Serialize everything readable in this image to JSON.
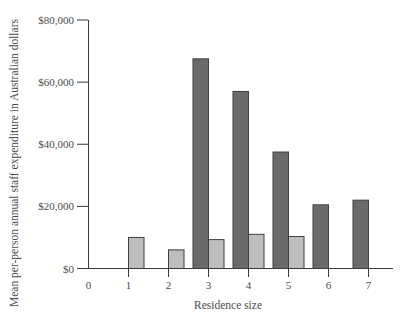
{
  "chart_data": {
    "type": "bar",
    "title": "",
    "xlabel": "Residence size",
    "ylabel": "Mean per-person annual staff expenditure in Australian dollars",
    "x_ticks": [
      "0",
      "1",
      "2",
      "3",
      "4",
      "5",
      "6",
      "7"
    ],
    "categories": [
      1,
      2,
      3,
      4,
      5,
      6,
      7
    ],
    "series": [
      {
        "name": "",
        "style": "dark",
        "color": "#6b6b6b",
        "position": "left-of-tick",
        "values": [
          null,
          null,
          67500,
          57000,
          37500,
          20500,
          22000
        ]
      },
      {
        "name": "",
        "style": "light",
        "color": "#bdbdbd",
        "position": "right-of-tick",
        "values": [
          10000,
          6000,
          9300,
          11000,
          10300,
          null,
          null
        ]
      }
    ],
    "y_ticks": [
      {
        "value": 0,
        "label": "$0"
      },
      {
        "value": 20000,
        "label": "$20,000"
      },
      {
        "value": 40000,
        "label": "$40,000"
      },
      {
        "value": 60000,
        "label": "$60,000"
      },
      {
        "value": 80000,
        "label": "$80,000"
      }
    ],
    "ylim": [
      0,
      80000
    ],
    "xlim": [
      0,
      7.6
    ],
    "grid": false,
    "legend": null,
    "bar_edge_color": "#3f3f3f"
  }
}
